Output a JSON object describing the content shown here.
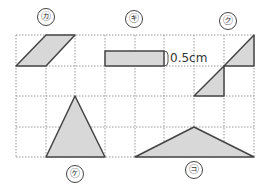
{
  "diagram": {
    "type": "grid-figures",
    "grid": {
      "x_lines": [
        16,
        46,
        75,
        105,
        135,
        164,
        194,
        224,
        254
      ],
      "y_lines": [
        35,
        66,
        96,
        127,
        157
      ],
      "line_color": "#9a9a9a",
      "style": "dotted"
    },
    "fill_color": "#d8d8d8",
    "stroke_color": "#444444",
    "figures": [
      {
        "id": "ka",
        "label": "㋕",
        "shape": "parallelogram",
        "points": [
          [
            16,
            66
          ],
          [
            46,
            66
          ],
          [
            75,
            35
          ],
          [
            46,
            35
          ]
        ],
        "label_pos": [
          46,
          17
        ]
      },
      {
        "id": "ki",
        "label": "㋖",
        "shape": "rectangle",
        "points": [
          [
            105,
            51
          ],
          [
            164,
            51
          ],
          [
            164,
            66
          ],
          [
            105,
            66
          ]
        ],
        "label_pos": [
          134,
          19
        ],
        "measurement": "0.5cm"
      },
      {
        "id": "ku",
        "label": "㋗",
        "shape": "two-triangles",
        "points_a": [
          [
            224,
            66
          ],
          [
            254,
            35
          ],
          [
            254,
            66
          ]
        ],
        "points_b": [
          [
            194,
            96
          ],
          [
            224,
            66
          ],
          [
            224,
            96
          ]
        ],
        "label_pos": [
          228,
          21
        ]
      },
      {
        "id": "ke",
        "label": "㋘",
        "shape": "triangle",
        "points": [
          [
            75,
            96
          ],
          [
            46,
            157
          ],
          [
            105,
            157
          ]
        ],
        "label_pos": [
          75,
          174
        ]
      },
      {
        "id": "ko",
        "label": "㋙",
        "shape": "triangle",
        "points": [
          [
            194,
            127
          ],
          [
            135,
            157
          ],
          [
            254,
            157
          ]
        ],
        "label_pos": [
          194,
          170
        ]
      }
    ],
    "measurement_text": "0.5cm"
  }
}
